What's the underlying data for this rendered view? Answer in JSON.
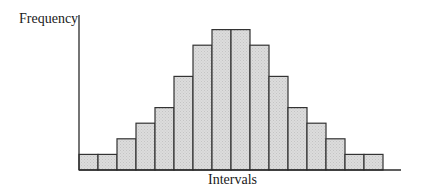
{
  "chart_data": {
    "type": "bar",
    "title": "",
    "xlabel": "Intervals",
    "ylabel": "Frequency",
    "categories": [
      "1",
      "2",
      "3",
      "4",
      "5",
      "6",
      "7",
      "8",
      "9",
      "10",
      "11",
      "12",
      "13",
      "14",
      "15",
      "16"
    ],
    "values": [
      1,
      1,
      2,
      3,
      4,
      6,
      8,
      9,
      9,
      8,
      6,
      4,
      3,
      2,
      1,
      1
    ],
    "ylim": [
      0,
      10
    ],
    "grid": false,
    "legend": null,
    "tick_labels": false,
    "bar_fill": "#d9d9d9",
    "bar_edge": "#333333"
  },
  "labels": {
    "ylabel": "Frequency",
    "xlabel": "Intervals"
  }
}
